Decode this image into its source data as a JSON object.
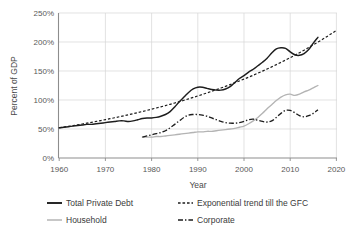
{
  "chart_data": {
    "type": "line",
    "title": "",
    "xlabel": "Year",
    "ylabel": "Percent of GDP",
    "xlim": [
      1958,
      2021
    ],
    "ylim": [
      0,
      250
    ],
    "grid": true,
    "legend_position": "bottom",
    "x_ticks": [
      "1960",
      "1970",
      "1980",
      "1990",
      "2000",
      "2010",
      "2020"
    ],
    "x_tick_values": [
      1960,
      1970,
      1980,
      1990,
      2000,
      2010,
      2020
    ],
    "y_ticks": [
      "0%",
      "50%",
      "100%",
      "150%",
      "200%",
      "250%"
    ],
    "y_tick_values": [
      0,
      50,
      100,
      150,
      200,
      250
    ],
    "series": [
      {
        "name": "Total Private Debt",
        "style": "solid",
        "color": "#1d1d1d",
        "x": [
          1960,
          1961,
          1962,
          1963,
          1964,
          1965,
          1966,
          1967,
          1968,
          1969,
          1970,
          1971,
          1972,
          1973,
          1974,
          1975,
          1976,
          1977,
          1978,
          1979,
          1980,
          1981,
          1982,
          1983,
          1984,
          1985,
          1986,
          1987,
          1988,
          1989,
          1990,
          1991,
          1992,
          1993,
          1994,
          1995,
          1996,
          1997,
          1998,
          1999,
          2000,
          2001,
          2002,
          2003,
          2004,
          2005,
          2006,
          2007,
          2008,
          2009,
          2010,
          2011,
          2012,
          2013,
          2014,
          2015,
          2016
        ],
        "values": [
          52,
          53,
          54,
          55,
          56,
          57,
          58,
          58,
          59,
          60,
          61,
          62,
          63,
          64,
          64,
          63,
          64,
          66,
          68,
          69,
          69,
          70,
          72,
          75,
          80,
          88,
          97,
          105,
          113,
          119,
          122,
          122,
          120,
          118,
          117,
          117,
          119,
          123,
          130,
          137,
          142,
          148,
          153,
          159,
          165,
          172,
          181,
          188,
          190,
          189,
          183,
          178,
          177,
          180,
          187,
          198,
          208
        ]
      },
      {
        "name": "Exponential trend till the GFC",
        "style": "dotted",
        "color": "#1d1d1d",
        "x": [
          1960,
          2020
        ],
        "values": [
          52,
          220
        ],
        "note": "exponential fit extrapolated to 2020"
      },
      {
        "name": "Household",
        "style": "solid",
        "color": "#b4b4b4",
        "x": [
          1978,
          1979,
          1980,
          1981,
          1982,
          1983,
          1984,
          1985,
          1986,
          1987,
          1988,
          1989,
          1990,
          1991,
          1992,
          1993,
          1994,
          1995,
          1996,
          1997,
          1998,
          1999,
          2000,
          2001,
          2002,
          2003,
          2004,
          2005,
          2006,
          2007,
          2008,
          2009,
          2010,
          2011,
          2012,
          2013,
          2014,
          2015,
          2016
        ],
        "values": [
          36,
          36,
          36,
          37,
          37,
          38,
          39,
          40,
          41,
          42,
          43,
          44,
          45,
          45,
          46,
          46,
          47,
          48,
          49,
          50,
          51,
          53,
          55,
          59,
          64,
          70,
          77,
          85,
          92,
          99,
          105,
          109,
          110,
          108,
          110,
          114,
          117,
          121,
          125
        ]
      },
      {
        "name": "Corporate",
        "style": "dash-dot",
        "color": "#1d1d1d",
        "x": [
          1978,
          1979,
          1980,
          1981,
          1982,
          1983,
          1984,
          1985,
          1986,
          1987,
          1988,
          1989,
          1990,
          1991,
          1992,
          1993,
          1994,
          1995,
          1996,
          1997,
          1998,
          1999,
          2000,
          2001,
          2002,
          2003,
          2004,
          2005,
          2006,
          2007,
          2008,
          2009,
          2010,
          2011,
          2012,
          2013,
          2014,
          2015,
          2016
        ],
        "values": [
          36,
          38,
          40,
          42,
          44,
          47,
          52,
          58,
          64,
          70,
          74,
          75,
          75,
          74,
          72,
          69,
          66,
          63,
          61,
          60,
          60,
          61,
          63,
          66,
          67,
          65,
          63,
          62,
          64,
          70,
          77,
          82,
          82,
          78,
          73,
          71,
          73,
          77,
          83
        ]
      }
    ],
    "legend": [
      {
        "label": "Total Private Debt",
        "style": "solid",
        "color": "#1d1d1d"
      },
      {
        "label": "Exponential trend till the GFC",
        "style": "dotted",
        "color": "#1d1d1d"
      },
      {
        "label": "Household",
        "style": "solid",
        "color": "#b4b4b4"
      },
      {
        "label": "Corporate",
        "style": "dash-dot",
        "color": "#1d1d1d"
      }
    ]
  }
}
